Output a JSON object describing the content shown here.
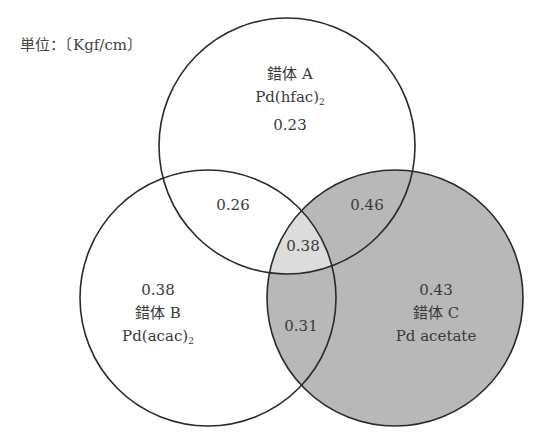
{
  "unit_label": "単位：〔Kgf/cm〕",
  "circles": [
    {
      "id": "A",
      "name": "錯体 A",
      "formula": "Pd(hfac)",
      "subscript": "2",
      "value": "0.23",
      "fill": "#ffffff"
    },
    {
      "id": "B",
      "name": "錯体 B",
      "formula": "Pd(acac)",
      "subscript": "2",
      "value": "0.38",
      "fill": "#ffffff"
    },
    {
      "id": "C",
      "name": "錯体 C",
      "formula": "Pd acetate",
      "subscript": "",
      "value": "0.43",
      "fill": "#b8b8b8"
    }
  ],
  "intersections": {
    "AB": "0.26",
    "AC": "0.46",
    "BC": "0.31",
    "ABC": "0.38"
  },
  "colors": {
    "stroke": "#2a2a2a",
    "c_fill": "#b8b8b8",
    "abc_fill": "#dcdcdc"
  }
}
